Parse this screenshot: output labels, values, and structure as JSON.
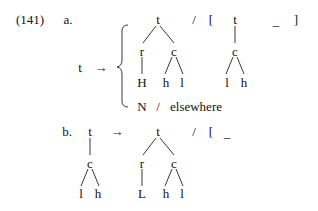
{
  "example": {
    "number": "(141)",
    "part_a": {
      "label": "a.",
      "lhs": "t",
      "arrow": "→",
      "case1": {
        "output_tree": {
          "root": "t",
          "left": "r",
          "left_child": "H",
          "right": "c",
          "right_children": [
            "h",
            "l"
          ]
        },
        "slash": "/",
        "open_bracket": "[",
        "context_tree": {
          "root": "t",
          "child": "c",
          "children": [
            "l",
            "h"
          ]
        },
        "focus": "_",
        "close_bracket": "]"
      },
      "case2": {
        "output": "N",
        "slash": "/",
        "condition": "elsewhere"
      }
    },
    "part_b": {
      "label": "b.",
      "input_tree": {
        "root": "t",
        "child": "c",
        "children": [
          "l",
          "h"
        ]
      },
      "arrow": "→",
      "output_tree": {
        "root": "t",
        "left": "r",
        "left_child": "L",
        "right": "c",
        "right_children": [
          "h",
          "l"
        ]
      },
      "slash": "/",
      "open_bracket": "[",
      "focus": "_"
    }
  }
}
